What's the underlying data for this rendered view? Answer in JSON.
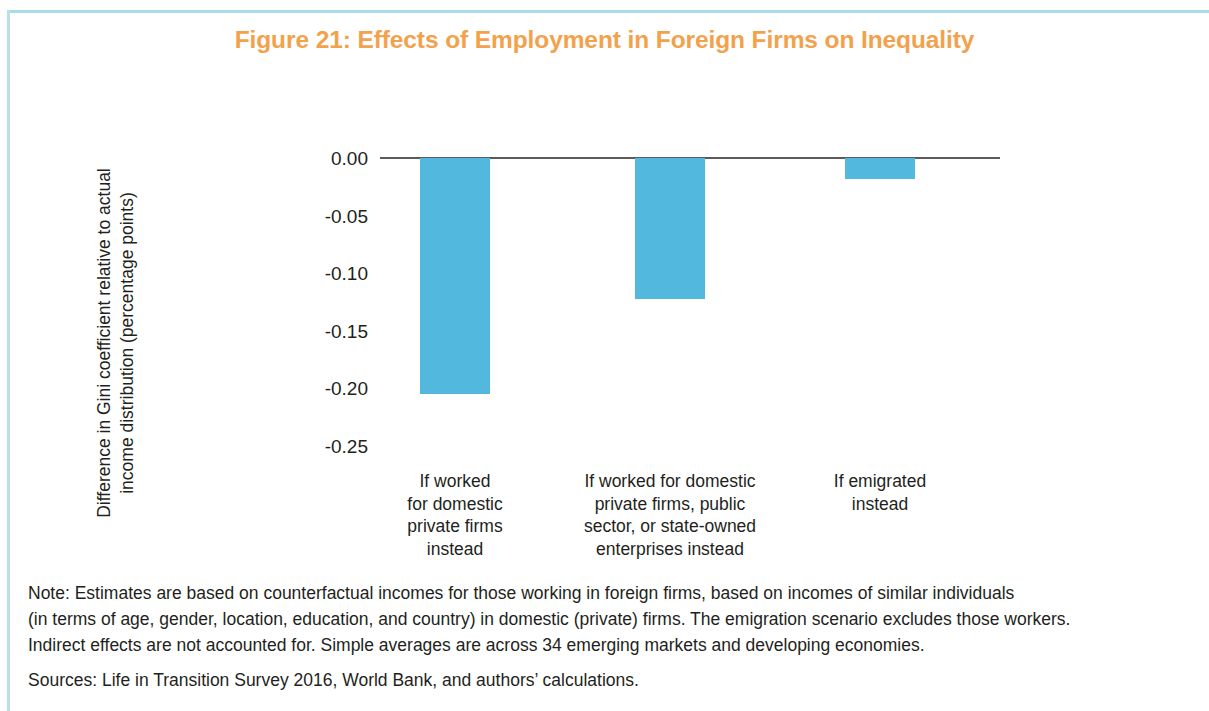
{
  "figure": {
    "title": "Figure 21: Effects of Employment in Foreign Firms on Inequality",
    "title_color": "#f2a24c",
    "bar_color": "#52b8dd",
    "rule_color": "#a9dce8"
  },
  "chart_data": {
    "type": "bar",
    "title": "Figure 21: Effects of Employment in Foreign Firms on Inequality",
    "xlabel": "",
    "ylabel": "Difference in Gini coefficient relative to actual income distribution (percentage points)",
    "categories": [
      "If worked\nfor domestic\nprivate firms\ninstead",
      "If worked for domestic\nprivate firms, public\nsector, or state-owned\nenterprises instead",
      "If emigrated\ninstead"
    ],
    "values": [
      -0.205,
      -0.122,
      -0.018
    ],
    "ylim": [
      -0.25,
      0.0
    ],
    "yticks": [
      0.0,
      -0.05,
      -0.1,
      -0.15,
      -0.2,
      -0.25
    ],
    "ytick_labels": [
      "0.00",
      "-0.05",
      "-0.10",
      "-0.15",
      "-0.20",
      "-0.25"
    ],
    "grid": false,
    "legend": false,
    "series": [
      {
        "name": "Difference in Gini coefficient",
        "values": [
          -0.205,
          -0.122,
          -0.018
        ]
      }
    ]
  },
  "footnotes": {
    "note_lines": [
      "Note: Estimates are based on counterfactual incomes for those working in foreign firms, based on incomes of similar individuals",
      "(in terms of age, gender, location, education, and country) in domestic (private) firms. The emigration scenario excludes those workers.",
      "Indirect effects are not accounted for. Simple averages are across 34 emerging markets and developing economies."
    ],
    "sources": "Sources: Life in Transition Survey 2016, World Bank, and authors’ calculations."
  }
}
